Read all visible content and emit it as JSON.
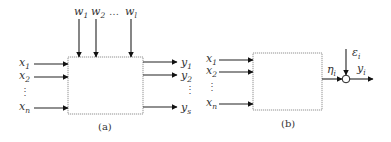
{
  "figure": {
    "panel_a": {
      "caption": "(a)",
      "top_inputs": [
        {
          "base": "w",
          "sub": "1"
        },
        {
          "base": "w",
          "sub": "2"
        },
        {
          "base": "w",
          "sub": "l"
        }
      ],
      "top_ellipsis": "…",
      "left_inputs": [
        {
          "base": "x",
          "sub": "1"
        },
        {
          "base": "x",
          "sub": "2"
        },
        {
          "base": "x",
          "sub": "n"
        }
      ],
      "left_ellipsis": "⋮",
      "right_outputs": [
        {
          "base": "y",
          "sub": "1"
        },
        {
          "base": "y",
          "sub": "2"
        },
        {
          "base": "y",
          "sub": "s"
        }
      ],
      "right_ellipsis": "⋮"
    },
    "panel_b": {
      "caption": "(b)",
      "left_inputs": [
        {
          "base": "x",
          "sub": "1"
        },
        {
          "base": "x",
          "sub": "2"
        },
        {
          "base": "x",
          "sub": "n"
        }
      ],
      "left_ellipsis": "⋮",
      "intermediate": {
        "base": "η",
        "sub": "i"
      },
      "noise": {
        "base": "ε",
        "sub": "i"
      },
      "output": {
        "base": "y",
        "sub": "i"
      }
    }
  }
}
